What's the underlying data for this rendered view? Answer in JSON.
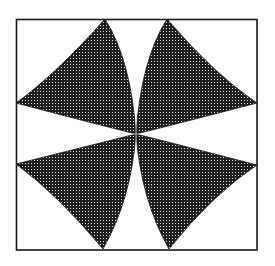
{
  "figure": {
    "colors": {
      "background": "#ffffff",
      "frame": "#1a1a1a",
      "petal_fill": "#1f1f1f",
      "stipple_dot": "#d8d8d8"
    },
    "frame": {
      "x": 16,
      "y": 19,
      "width": 241,
      "height": 231
    },
    "center": {
      "x": 136,
      "y": 134
    },
    "petals": [
      {
        "name": "top-left",
        "tip_edge_a": [
          105,
          19
        ],
        "tip_edge_b": [
          16,
          103
        ]
      },
      {
        "name": "top-right",
        "tip_edge_a": [
          167,
          19
        ],
        "tip_edge_b": [
          257,
          103
        ]
      },
      {
        "name": "bottom-left",
        "tip_edge_a": [
          16,
          164
        ],
        "tip_edge_b": [
          103,
          249
        ]
      },
      {
        "name": "bottom-right",
        "tip_edge_a": [
          257,
          165
        ],
        "tip_edge_b": [
          169,
          249
        ]
      }
    ]
  }
}
